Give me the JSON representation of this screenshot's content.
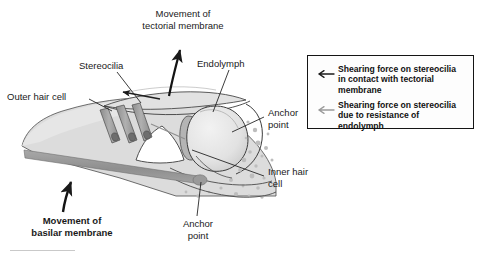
{
  "figure": {
    "labels": [
      {
        "id": "movement-tectorial",
        "text": "Movement of\ntectorial membrane",
        "bold": false
      },
      {
        "id": "stereocilia",
        "text": "Stereocilia",
        "bold": false
      },
      {
        "id": "endolymph",
        "text": "Endolymph",
        "bold": false
      },
      {
        "id": "outer-hair-cell",
        "text": "Outer hair cell",
        "bold": false
      },
      {
        "id": "anchor-point-right",
        "text": "Anchor\npoint",
        "bold": false
      },
      {
        "id": "inner-hair-cell",
        "text": "Inner hair\ncell",
        "bold": false
      },
      {
        "id": "anchor-point-bottom",
        "text": "Anchor\npoint",
        "bold": false
      },
      {
        "id": "movement-basilar",
        "text": "Movement of\nbasilar membrane",
        "bold": true
      }
    ]
  },
  "legend": {
    "items": [
      {
        "arrow_color": "#1a1a1a",
        "text": "Shearing force on stereocilia\nin contact with tectorial\nmembrane"
      },
      {
        "arrow_color": "#9a9a9a",
        "text": "Shearing force on stereocilia\ndue to resistance of\nendolymph"
      }
    ]
  },
  "colors": {
    "tissue_fill": "#dcdcdc",
    "tissue_fill_light": "#e6e6e6",
    "outline": "#3a3a3a",
    "hair_cell": "#9e9e9e",
    "basilar_membrane": "#9a9a9a",
    "stipple": "#bdbdbd",
    "legend_border": "#141414",
    "arrow_dark": "#1a1a1a",
    "arrow_light": "#9a9a9a",
    "rule": "#c9c9c9"
  }
}
